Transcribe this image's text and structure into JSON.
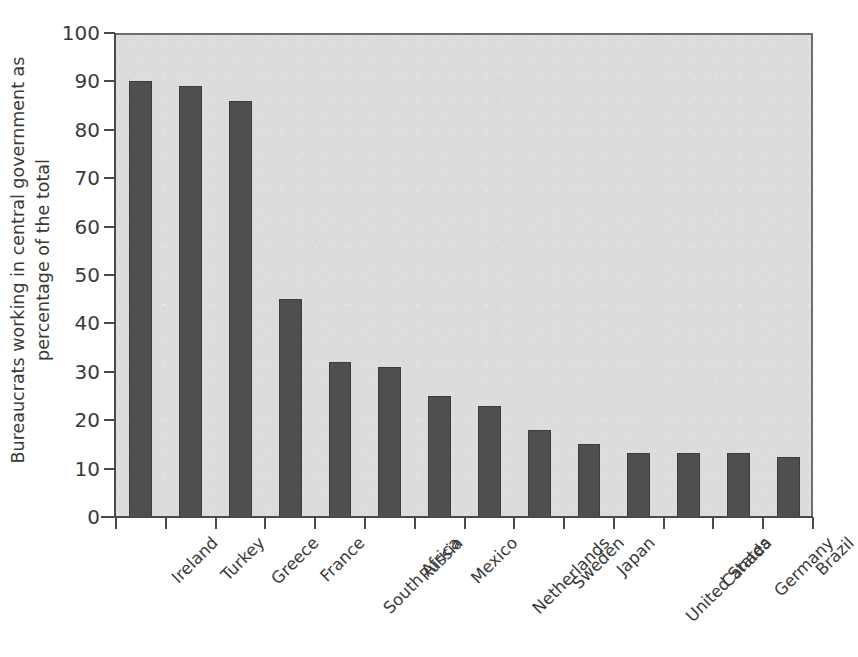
{
  "chart_data": {
    "type": "bar",
    "title": "",
    "subtitle": "",
    "xlabel": "",
    "ylabel": "Bureaucrats working in central government as percentage of the total",
    "ylabel_lines": [
      "Bureaucrats working in central government as",
      "percentage of the total"
    ],
    "categories": [
      "Ireland",
      "Turkey",
      "Greece",
      "France",
      "South Africa",
      "Russia",
      "Mexico",
      "Netherlands",
      "Sweden",
      "Japan",
      "United States",
      "Canada",
      "Germany",
      "Brazil"
    ],
    "values": [
      90,
      89,
      86,
      45,
      32,
      31,
      25,
      23,
      18,
      15,
      13.3,
      13.3,
      13.3,
      12.3
    ],
    "ylim": [
      0,
      100
    ],
    "ytick_values": [
      0,
      10,
      20,
      30,
      40,
      50,
      60,
      70,
      80,
      90,
      100
    ],
    "ytick_labels": [
      "0",
      "10",
      "20",
      "30",
      "40",
      "50",
      "60",
      "70",
      "80",
      "90",
      "100"
    ],
    "grid": false,
    "legend": false,
    "legend_position": "none",
    "xtick_label_rotation_degrees": -45,
    "colors": {
      "bar_fill": "#4f4f4f",
      "bar_edge": "#3c3c3c",
      "plot_background": "#dcdcdc",
      "axis_line": "#4a4a4a",
      "frame_line": "#6e6e6e",
      "text": "#3a3a3a",
      "page_background": "#ffffff"
    }
  }
}
